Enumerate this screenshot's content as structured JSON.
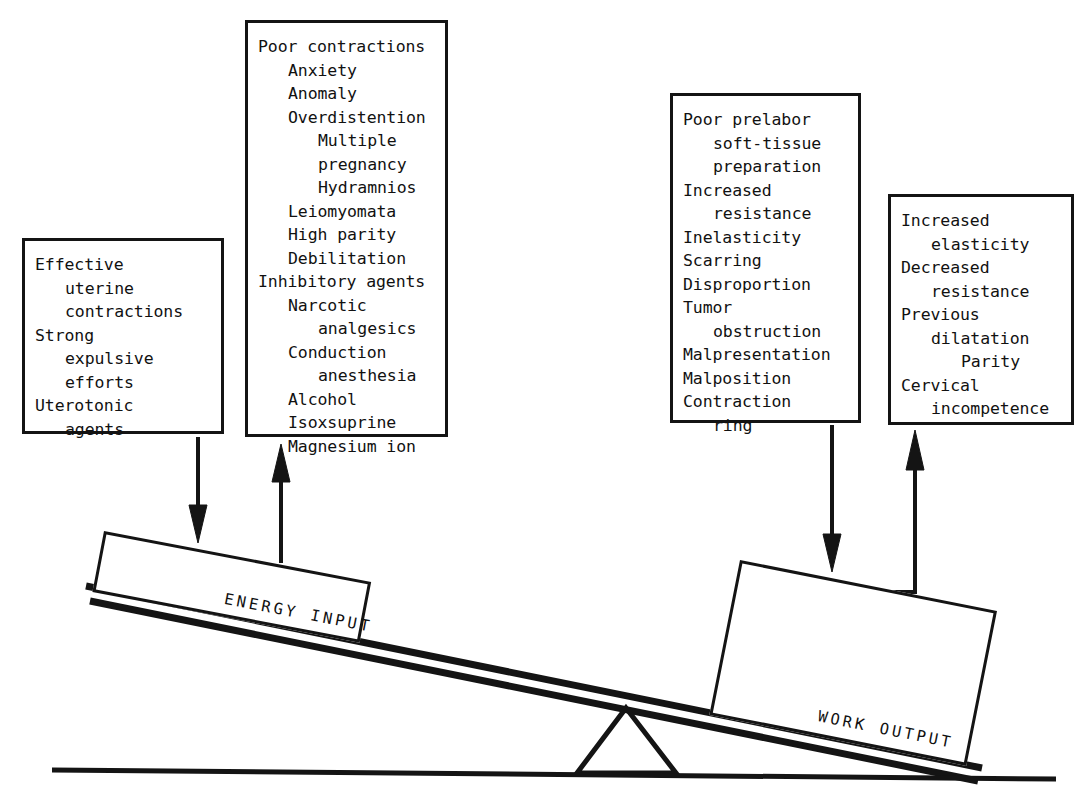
{
  "diagram": {
    "ink_color": "#141414",
    "background": "#ffffff"
  },
  "boxes": {
    "effective": {
      "name": "Effective uterine contractions",
      "lines": [
        {
          "text": "Effective",
          "indent": 0
        },
        {
          "text": "uterine",
          "indent": 1
        },
        {
          "text": "contractions",
          "indent": 1
        },
        {
          "text": "Strong",
          "indent": 0
        },
        {
          "text": "expulsive",
          "indent": 1
        },
        {
          "text": "efforts",
          "indent": 1
        },
        {
          "text": "Uterotonic",
          "indent": 0
        },
        {
          "text": "agents",
          "indent": 1
        }
      ]
    },
    "poor_contractions": {
      "name": "Poor contractions",
      "lines": [
        {
          "text": "Poor contractions",
          "indent": 0
        },
        {
          "text": "Anxiety",
          "indent": 1
        },
        {
          "text": "Anomaly",
          "indent": 1
        },
        {
          "text": "Overdistention",
          "indent": 1
        },
        {
          "text": "Multiple",
          "indent": 2
        },
        {
          "text": "pregnancy",
          "indent": 2
        },
        {
          "text": "Hydramnios",
          "indent": 2
        },
        {
          "text": "Leiomyomata",
          "indent": 1
        },
        {
          "text": "High parity",
          "indent": 1
        },
        {
          "text": "Debilitation",
          "indent": 1
        },
        {
          "text": "Inhibitory agents",
          "indent": 0
        },
        {
          "text": "Narcotic",
          "indent": 1
        },
        {
          "text": "analgesics",
          "indent": 2
        },
        {
          "text": "Conduction",
          "indent": 1
        },
        {
          "text": "anesthesia",
          "indent": 2
        },
        {
          "text": "Alcohol",
          "indent": 1
        },
        {
          "text": "Isoxsuprine",
          "indent": 1
        },
        {
          "text": "Magnesium ion",
          "indent": 1
        }
      ]
    },
    "poor_prelabor": {
      "name": "Poor prelabor soft-tissue preparation",
      "lines": [
        {
          "text": "Poor prelabor",
          "indent": 0
        },
        {
          "text": "soft-tissue",
          "indent": 1
        },
        {
          "text": "preparation",
          "indent": 1
        },
        {
          "text": "Increased",
          "indent": 0
        },
        {
          "text": "resistance",
          "indent": 1
        },
        {
          "text": "Inelasticity",
          "indent": 0
        },
        {
          "text": "Scarring",
          "indent": 0
        },
        {
          "text": "Disproportion",
          "indent": 0
        },
        {
          "text": "Tumor",
          "indent": 0
        },
        {
          "text": "obstruction",
          "indent": 1
        },
        {
          "text": "Malpresentation",
          "indent": 0
        },
        {
          "text": "Malposition",
          "indent": 0
        },
        {
          "text": "Contraction",
          "indent": 0
        },
        {
          "text": "ring",
          "indent": 1
        }
      ]
    },
    "increased_elasticity": {
      "name": "Increased elasticity",
      "lines": [
        {
          "text": "Increased",
          "indent": 0
        },
        {
          "text": "elasticity",
          "indent": 1
        },
        {
          "text": "Decreased",
          "indent": 0
        },
        {
          "text": "resistance",
          "indent": 1
        },
        {
          "text": "Previous",
          "indent": 0
        },
        {
          "text": "dilatation",
          "indent": 1
        },
        {
          "text": "Parity",
          "indent": 2
        },
        {
          "text": "Cervical",
          "indent": 0
        },
        {
          "text": "incompetence",
          "indent": 1
        }
      ]
    }
  },
  "beam_labels": {
    "energy_input": "ENERGY INPUT",
    "work_output": "WORK OUTPUT"
  },
  "arrows": [
    {
      "name": "arrow-effective-to-energy-input",
      "direction": "down"
    },
    {
      "name": "arrow-poor-contractions-from-energy-input",
      "direction": "up"
    },
    {
      "name": "arrow-poor-prelabor-to-work-output",
      "direction": "down"
    },
    {
      "name": "arrow-increased-elasticity-from-work-output",
      "direction": "up"
    }
  ],
  "fulcrum": {
    "name": "fulcrum-triangle"
  },
  "ground": {
    "name": "ground-line"
  }
}
